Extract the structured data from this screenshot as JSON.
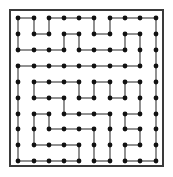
{
  "puzzle": {
    "type": "dot-grid-maze",
    "grid": {
      "cols": 10,
      "rows": 10
    },
    "colors": {
      "line": "#555555",
      "dot": "#111111",
      "frame": "#3a3a3a",
      "background": "#ffffff"
    },
    "col_x": [
      18,
      34,
      49,
      64,
      79,
      94,
      110,
      125,
      140,
      156
    ],
    "row_y": [
      18,
      34,
      50,
      66,
      82,
      98,
      114,
      129,
      145,
      161
    ],
    "edges": [
      [
        0,
        0,
        1,
        0
      ],
      [
        2,
        0,
        3,
        0
      ],
      [
        3,
        0,
        4,
        0
      ],
      [
        4,
        0,
        5,
        0
      ],
      [
        6,
        0,
        7,
        0
      ],
      [
        7,
        0,
        8,
        0
      ],
      [
        8,
        0,
        9,
        0
      ],
      [
        0,
        0,
        0,
        1
      ],
      [
        0,
        1,
        0,
        2
      ],
      [
        1,
        0,
        1,
        1
      ],
      [
        2,
        0,
        2,
        1
      ],
      [
        5,
        0,
        5,
        1
      ],
      [
        6,
        0,
        6,
        1
      ],
      [
        9,
        0,
        9,
        1
      ],
      [
        9,
        1,
        9,
        2
      ],
      [
        9,
        2,
        9,
        3
      ],
      [
        1,
        1,
        2,
        1
      ],
      [
        3,
        1,
        4,
        1
      ],
      [
        5,
        1,
        6,
        1
      ],
      [
        7,
        1,
        8,
        1
      ],
      [
        3,
        1,
        3,
        2
      ],
      [
        4,
        1,
        4,
        2
      ],
      [
        7,
        1,
        7,
        2
      ],
      [
        8,
        1,
        8,
        2
      ],
      [
        8,
        2,
        8,
        3
      ],
      [
        0,
        2,
        1,
        2
      ],
      [
        1,
        2,
        2,
        2
      ],
      [
        2,
        2,
        3,
        2
      ],
      [
        4,
        2,
        5,
        2
      ],
      [
        5,
        2,
        6,
        2
      ],
      [
        6,
        2,
        7,
        2
      ],
      [
        0,
        3,
        1,
        3
      ],
      [
        1,
        3,
        2,
        3
      ],
      [
        2,
        3,
        3,
        3
      ],
      [
        3,
        3,
        4,
        3
      ],
      [
        4,
        3,
        5,
        3
      ],
      [
        5,
        3,
        6,
        3
      ],
      [
        6,
        3,
        7,
        3
      ],
      [
        7,
        3,
        8,
        3
      ],
      [
        0,
        3,
        0,
        4
      ],
      [
        0,
        4,
        0,
        5
      ],
      [
        0,
        5,
        0,
        6
      ],
      [
        0,
        6,
        0,
        7
      ],
      [
        0,
        7,
        0,
        8
      ],
      [
        0,
        8,
        0,
        9
      ],
      [
        9,
        3,
        9,
        4
      ],
      [
        9,
        4,
        9,
        5
      ],
      [
        9,
        5,
        9,
        6
      ],
      [
        9,
        6,
        9,
        7
      ],
      [
        9,
        7,
        9,
        8
      ],
      [
        9,
        8,
        9,
        9
      ],
      [
        1,
        4,
        2,
        4
      ],
      [
        2,
        4,
        3,
        4
      ],
      [
        3,
        4,
        4,
        4
      ],
      [
        5,
        4,
        6,
        4
      ],
      [
        7,
        4,
        8,
        4
      ],
      [
        1,
        4,
        1,
        5
      ],
      [
        4,
        4,
        4,
        5
      ],
      [
        5,
        4,
        5,
        5
      ],
      [
        6,
        4,
        6,
        5
      ],
      [
        7,
        4,
        7,
        5
      ],
      [
        8,
        4,
        8,
        5
      ],
      [
        1,
        5,
        2,
        5
      ],
      [
        2,
        5,
        3,
        5
      ],
      [
        4,
        5,
        5,
        5
      ],
      [
        6,
        5,
        7,
        5
      ],
      [
        3,
        5,
        3,
        6
      ],
      [
        8,
        5,
        8,
        6
      ],
      [
        1,
        6,
        2,
        6
      ],
      [
        3,
        6,
        4,
        6
      ],
      [
        4,
        6,
        5,
        6
      ],
      [
        5,
        6,
        6,
        6
      ],
      [
        7,
        6,
        8,
        6
      ],
      [
        1,
        6,
        1,
        7
      ],
      [
        1,
        7,
        1,
        8
      ],
      [
        2,
        6,
        2,
        7
      ],
      [
        6,
        6,
        6,
        7
      ],
      [
        6,
        7,
        6,
        8
      ],
      [
        6,
        8,
        6,
        9
      ],
      [
        7,
        6,
        7,
        7
      ],
      [
        2,
        7,
        3,
        7
      ],
      [
        3,
        7,
        4,
        7
      ],
      [
        4,
        7,
        5,
        7
      ],
      [
        7,
        7,
        8,
        7
      ],
      [
        5,
        7,
        5,
        8
      ],
      [
        8,
        7,
        8,
        8
      ],
      [
        1,
        8,
        2,
        8
      ],
      [
        2,
        8,
        3,
        8
      ],
      [
        3,
        8,
        4,
        8
      ],
      [
        7,
        8,
        8,
        8
      ],
      [
        4,
        8,
        4,
        9
      ],
      [
        5,
        8,
        5,
        9
      ],
      [
        7,
        8,
        7,
        9
      ],
      [
        0,
        9,
        1,
        9
      ],
      [
        1,
        9,
        2,
        9
      ],
      [
        2,
        9,
        3,
        9
      ],
      [
        3,
        9,
        4,
        9
      ],
      [
        5,
        9,
        6,
        9
      ],
      [
        7,
        9,
        8,
        9
      ],
      [
        8,
        9,
        9,
        9
      ]
    ]
  }
}
